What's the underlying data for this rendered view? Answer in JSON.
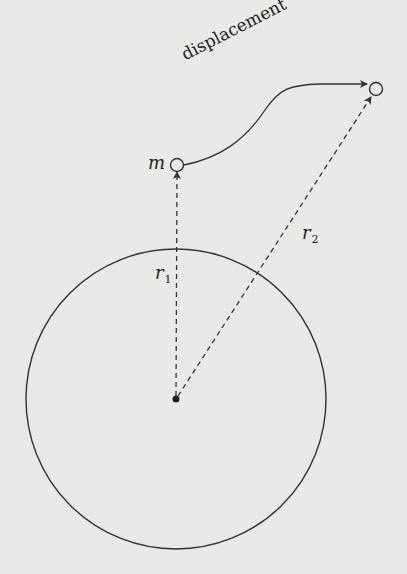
{
  "diagram": {
    "labels": {
      "mass": "m",
      "displacement": "displacement",
      "r1_base": "r",
      "r1_sub": "1",
      "r2_base": "r",
      "r2_sub": "2"
    },
    "colors": {
      "background": "#e9e9e7",
      "stroke": "#333333"
    },
    "elements": {
      "planet_circle": {
        "cx": 176,
        "cy": 399,
        "r": 150
      },
      "center_point": {
        "cx": 176,
        "cy": 399
      },
      "initial_position": {
        "cx": 177,
        "cy": 164
      },
      "final_position": {
        "cx": 376,
        "cy": 89
      },
      "vectors": [
        "r1",
        "r2"
      ],
      "path": "displacement"
    }
  }
}
